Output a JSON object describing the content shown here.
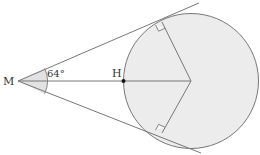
{
  "diagram": {
    "type": "geometry",
    "labels": {
      "point_m": "M",
      "point_h": "H",
      "angle": "64°"
    },
    "colors": {
      "line": "#777777",
      "circle_fill": "#ececec",
      "angle_fill": "#e2e2e2",
      "point": "#111111",
      "text": "#333333"
    }
  }
}
